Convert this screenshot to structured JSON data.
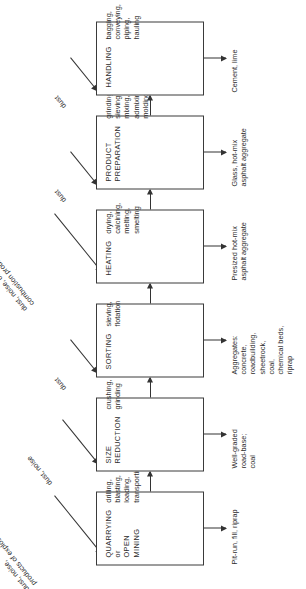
{
  "diagram": {
    "type": "process-flow",
    "orientation": "rotated-90-ccw",
    "stages": [
      {
        "id": "quarrying",
        "title": "QUARRYING\nor\nOPEN MINING",
        "operations": "drilling,\nblasting,\nloading,\ntransporting",
        "emission": "dust, noise,\nproducts of explosion",
        "product": "Pit-run, fill, riprap"
      },
      {
        "id": "size-reduction",
        "title": "SIZE\nREDUCTION",
        "operations": "crushing,\ngrinding",
        "emission": "dust, noise",
        "product": "Well-graded\nroad-base;\ncoal"
      },
      {
        "id": "sorting",
        "title": "SORTING",
        "operations": "sieving,\nflotation",
        "emission": "dust",
        "product": "Aggregates:\nconcrete,\nroadbuilding,\nsheetrock,\ncoal,\nchemical beds,\nriprap"
      },
      {
        "id": "heating",
        "title": "HEATING",
        "operations": "drying,\ncalcining,\nmelting,\nsmelting",
        "emission": "dust, noise, off-gases,\ncombustion products",
        "product": "Presized  hot-mix\nasphalt aggregate"
      },
      {
        "id": "product-preparation",
        "title": "PRODUCT\nPREPARATION",
        "operations": "grinding,\nsieving,\nmixing,\nadmixing,\nmolding",
        "emission": "dust",
        "product": "Glass, hot-mix\nasphalt aggregate"
      },
      {
        "id": "handling",
        "title": "HANDLING",
        "operations": "bagging,\nconveying,\npiping,\nhauling",
        "emission": "dust",
        "product": "Cement, lime"
      }
    ],
    "colors": {
      "line": "#333333",
      "text": "#2b2b2b",
      "background": "#ffffff"
    }
  }
}
